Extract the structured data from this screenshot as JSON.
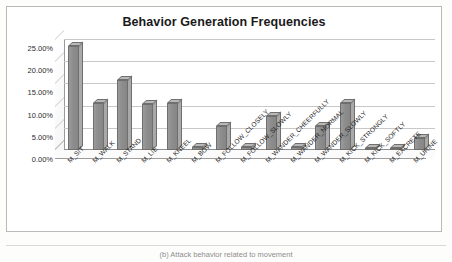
{
  "figure": {
    "title": "Behavior Generation Frequencies",
    "caption": "(b) Attack behavior related to movement"
  },
  "chart_data": {
    "type": "bar",
    "title": "Behavior Generation Frequencies",
    "xlabel": "",
    "ylabel": "",
    "ylim": [
      0,
      25
    ],
    "ytick_labels": [
      "25.00%",
      "20.00%",
      "15.00%",
      "10.00%",
      "5.00%",
      "0.00%"
    ],
    "ytick_values": [
      25,
      20,
      15,
      10,
      5,
      0
    ],
    "grid": true,
    "legend": "none",
    "style": "3d-column",
    "categories": [
      "M_SIT",
      "M_WALK",
      "M_STAND",
      "M_LIE",
      "M_KNEEL",
      "M_BOW",
      "M_FOLLOW_CLOSELY",
      "M_FOLLOW_SLOWLY",
      "M_WANDER_CHEERFULLY",
      "M_WANDER_NORMAL",
      "M_WANDER_SLOWLY",
      "M_KICK_STRONGLY",
      "M_KICK_SOFTLY",
      "M_EXCRETE",
      "M_URINE"
    ],
    "values": [
      23.5,
      10.5,
      15.8,
      10.4,
      10.5,
      0.6,
      5.3,
      0.6,
      7.6,
      0.6,
      5.3,
      10.5,
      0.5,
      0.5,
      2.6
    ],
    "value_labels": [
      "23.50%",
      "10.50%",
      "15.80%",
      "10.40%",
      "10.50%",
      "0.60%",
      "5.30%",
      "0.60%",
      "7.60%",
      "0.60%",
      "5.30%",
      "10.50%",
      "0.50%",
      "0.50%",
      "2.60%"
    ]
  },
  "colors": {
    "bar_front": "#8e8e8e",
    "bar_top": "#b8b8b8",
    "bar_side": "#a9a9a9",
    "bar_outline": "#6f6f6f",
    "gridline": "#c8c8c8",
    "frame": "#b9b9b9",
    "title_text": "#1a1a1a",
    "axis_text": "#2c2c2c",
    "plot_background": "#ffffff"
  }
}
